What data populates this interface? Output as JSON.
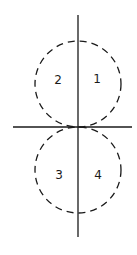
{
  "diagram": {
    "stroke_color": "#1a1a1a",
    "background": "#ffffff",
    "axes": {
      "vertical": {
        "x": 78,
        "y1": 15,
        "y2": 237
      },
      "horizontal": {
        "y": 127,
        "x1": 13,
        "x2": 132
      }
    },
    "circles": [
      {
        "name": "upper",
        "cx": 78,
        "cy": 84,
        "r": 43,
        "style": "dashed"
      },
      {
        "name": "lower",
        "cx": 78,
        "cy": 170,
        "r": 43,
        "style": "dashed"
      }
    ],
    "labels": [
      {
        "text": "1",
        "quadrant": "upper-right",
        "x": 97,
        "y": 83
      },
      {
        "text": "2",
        "quadrant": "upper-left",
        "x": 58,
        "y": 84
      },
      {
        "text": "3",
        "quadrant": "lower-left",
        "x": 59,
        "y": 179
      },
      {
        "text": "4",
        "quadrant": "lower-right",
        "x": 98,
        "y": 179
      }
    ]
  }
}
